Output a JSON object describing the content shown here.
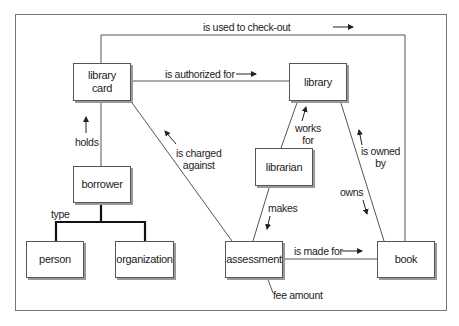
{
  "diagram": {
    "type": "entity-relationship",
    "entities": {
      "library_card": {
        "line1": "library",
        "line2": "card"
      },
      "library": "library",
      "librarian": "librarian",
      "borrower": "borrower",
      "person": "person",
      "organization": "organization",
      "assessment": "assessment",
      "book": "book"
    },
    "relationships": {
      "is_used_to_check_out": "is used to check-out",
      "is_authorized_for": "is authorized for",
      "holds": "holds",
      "is_charged_against": {
        "line1": "is charged",
        "line2": "against"
      },
      "works_for": {
        "line1": "works",
        "line2": "for"
      },
      "is_owned_by": {
        "line1": "is owned",
        "line2": "by"
      },
      "owns": "owns",
      "makes": "makes",
      "is_made_for": "is made for",
      "type": "type",
      "fee_amount": "fee amount"
    },
    "colors": {
      "line": "#555555",
      "shadow": "#9a9a9a",
      "text": "#222222"
    }
  }
}
